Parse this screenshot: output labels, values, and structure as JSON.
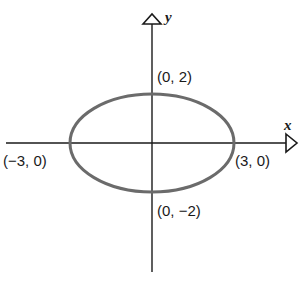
{
  "diagram": {
    "type": "ellipse-on-axes",
    "axes": {
      "x_label": "x",
      "y_label": "y"
    },
    "ellipse": {
      "center": [
        0,
        0
      ],
      "semi_major_x": 3,
      "semi_minor_y": 2,
      "stroke_color": "#6b6b6b"
    },
    "points": [
      {
        "id": "top",
        "label": "(0, 2)",
        "coord": [
          0,
          2
        ]
      },
      {
        "id": "bottom",
        "label": "(0, −2)",
        "coord": [
          0,
          -2
        ]
      },
      {
        "id": "left",
        "label": "(−3, 0)",
        "coord": [
          -3,
          0
        ]
      },
      {
        "id": "right",
        "label": "(3, 0)",
        "coord": [
          3,
          0
        ]
      }
    ]
  }
}
